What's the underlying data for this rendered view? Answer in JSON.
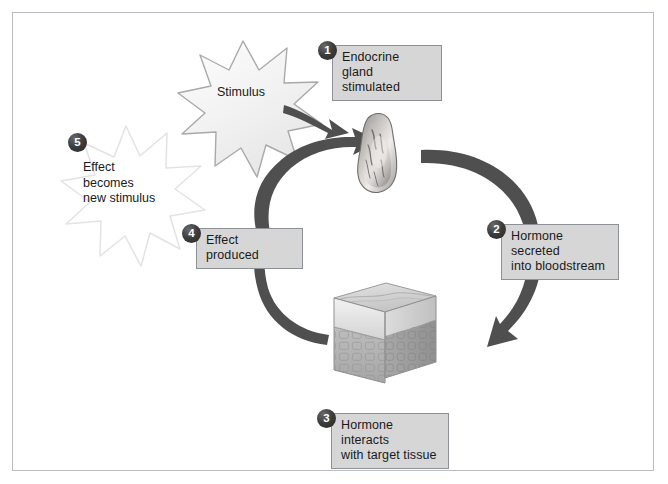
{
  "figure": {
    "border_color": "#b9bcc0",
    "background": "#ffffff"
  },
  "theme": {
    "callout_fill": "#d6d6d6",
    "callout_border": "#8d9095",
    "badge_fill": "#3c3c3c",
    "badge_text": "#ffffff",
    "arrow_color": "#545454",
    "text_color": "#1a1a1a",
    "star_outline": "#b8b8b8",
    "star_fill": "#f4f4f4",
    "ghost_star_outline": "#e2e2e2"
  },
  "steps": [
    {
      "number": "1",
      "label": "Endocrine gland\nstimulated",
      "name": "step-1-endocrine-gland-stimulated"
    },
    {
      "number": "2",
      "label": "Hormone secreted\ninto bloodstream",
      "name": "step-2-hormone-secreted"
    },
    {
      "number": "3",
      "label": "Hormone interacts\nwith target tissue",
      "name": "step-3-hormone-interacts"
    },
    {
      "number": "4",
      "label": "Effect produced",
      "name": "step-4-effect-produced"
    },
    {
      "number": "5",
      "label": "Effect\nbecomes\nnew stimulus",
      "name": "step-5-effect-becomes-new-stimulus"
    }
  ],
  "starbursts": [
    {
      "name": "stimulus-starburst",
      "label": "Stimulus",
      "style": "filled"
    },
    {
      "name": "new-stimulus-starburst",
      "label": "",
      "style": "ghost"
    }
  ],
  "illustrations": [
    {
      "name": "endocrine-gland-illustration",
      "caption": "endocrine gland"
    },
    {
      "name": "target-tissue-block-illustration",
      "caption": "target tissue block"
    }
  ],
  "arrows": [
    {
      "name": "arrow-stimulus-to-gland",
      "from": "Stimulus",
      "to": "Endocrine gland"
    },
    {
      "name": "arrow-gland-to-bloodstream",
      "from": "Endocrine gland",
      "to": "Target tissue"
    },
    {
      "name": "arrow-tissue-to-effect",
      "from": "Target tissue",
      "to": "Effect produced"
    },
    {
      "name": "arrow-effect-to-gland",
      "from": "Effect produced",
      "to": "Endocrine gland"
    }
  ]
}
